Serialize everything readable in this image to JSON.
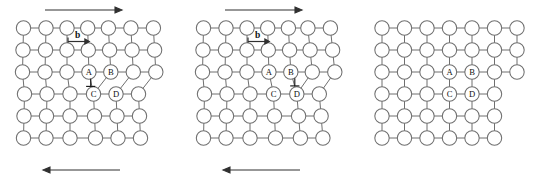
{
  "figure": {
    "panel_count": 3,
    "colors": {
      "atom_fill": "#ffffff",
      "atom_stroke": "#6f6f6f",
      "bond_stroke": "#6f6f6f",
      "arrow": "#303030",
      "label_text": "#101010",
      "background": "#ffffff"
    }
  },
  "lattice": {
    "rows": 6,
    "atom_radius": 7.2,
    "col_spacing": 22.5,
    "row_spacing": 22.0,
    "origin_x": 22,
    "origin_y": 28
  },
  "panels": [
    {
      "id": "panel-1",
      "name": "initial-dislocation",
      "x_offset": 0,
      "top_arrow": {
        "visible": true,
        "direction": "right",
        "label": ""
      },
      "bottom_arrow": {
        "visible": true,
        "direction": "left",
        "label": ""
      },
      "burgers": {
        "visible": true,
        "label": "b",
        "direction": "right"
      },
      "dislocation_symbol": {
        "visible": true,
        "glyph": "⊥",
        "position": "left"
      },
      "atom_labels": [
        {
          "id": "A",
          "text": "A"
        },
        {
          "id": "B",
          "text": "B"
        },
        {
          "id": "C",
          "text": "C"
        },
        {
          "id": "D",
          "text": "D"
        }
      ],
      "step": {
        "visible": false
      }
    },
    {
      "id": "panel-2",
      "name": "dislocation-glided-one-step",
      "x_offset": 180,
      "top_arrow": {
        "visible": true,
        "direction": "right",
        "label": ""
      },
      "bottom_arrow": {
        "visible": true,
        "direction": "left",
        "label": ""
      },
      "burgers": {
        "visible": true,
        "label": "b",
        "direction": "right"
      },
      "dislocation_symbol": {
        "visible": true,
        "glyph": "⊥",
        "position": "right"
      },
      "atom_labels": [
        {
          "id": "A",
          "text": "A"
        },
        {
          "id": "B",
          "text": "B"
        },
        {
          "id": "C",
          "text": "C"
        },
        {
          "id": "D",
          "text": "D"
        }
      ],
      "step": {
        "visible": false
      }
    },
    {
      "id": "panel-3",
      "name": "dislocation-exited-step-formed",
      "x_offset": 360,
      "top_arrow": {
        "visible": false,
        "direction": "right",
        "label": ""
      },
      "bottom_arrow": {
        "visible": false,
        "direction": "left",
        "label": ""
      },
      "burgers": {
        "visible": false,
        "label": "b",
        "direction": "right"
      },
      "dislocation_symbol": {
        "visible": false,
        "glyph": "⊥",
        "position": "none"
      },
      "atom_labels": [
        {
          "id": "A",
          "text": "A"
        },
        {
          "id": "B",
          "text": "B"
        },
        {
          "id": "C",
          "text": "C"
        },
        {
          "id": "D",
          "text": "D"
        }
      ],
      "step": {
        "visible": true,
        "location": "right-edge"
      }
    }
  ]
}
